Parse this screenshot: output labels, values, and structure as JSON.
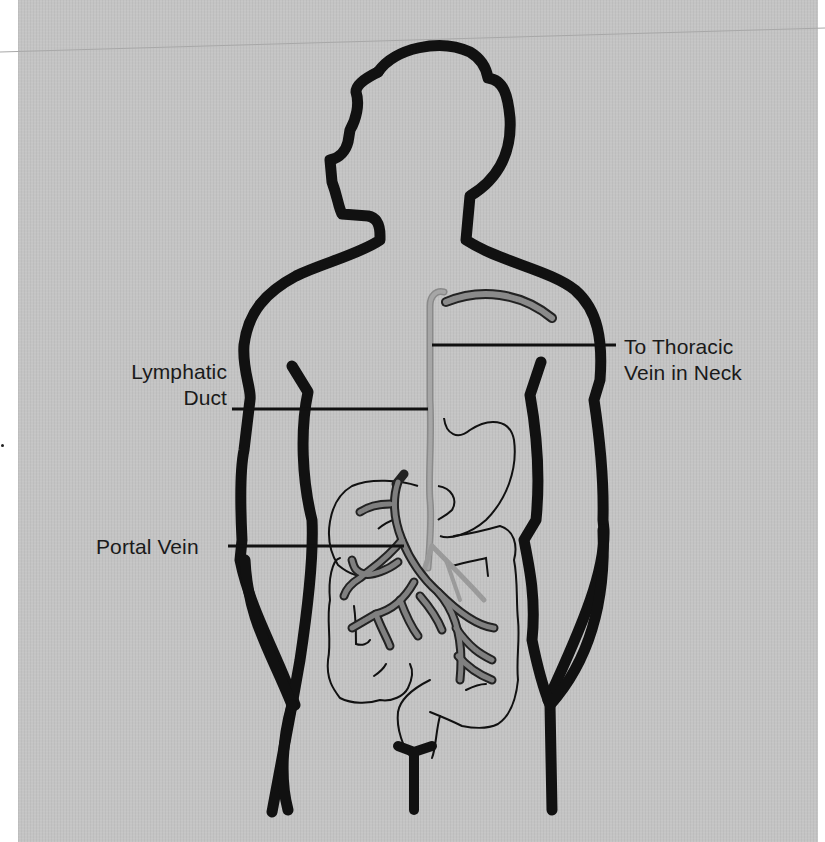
{
  "figure": {
    "background_color": "#c4c4c4",
    "outline_color": "#111111",
    "vessel_color_lymph": "#9a9a9a",
    "vessel_color_portal": "#7d7d7d"
  },
  "labels": {
    "lymphatic_duct": {
      "line1": "Lymphatic",
      "line2": "Duct"
    },
    "thoracic_vein": {
      "line1": "To Thoracic",
      "line2": "Vein in Neck"
    },
    "portal_vein": {
      "line1": "Portal Vein"
    }
  },
  "structures": [
    "body-outline",
    "left-arm",
    "right-arm",
    "lymphatic-duct",
    "thoracic-vein",
    "liver",
    "stomach",
    "portal-vein",
    "small-intestine",
    "large-intestine",
    "rectum"
  ]
}
